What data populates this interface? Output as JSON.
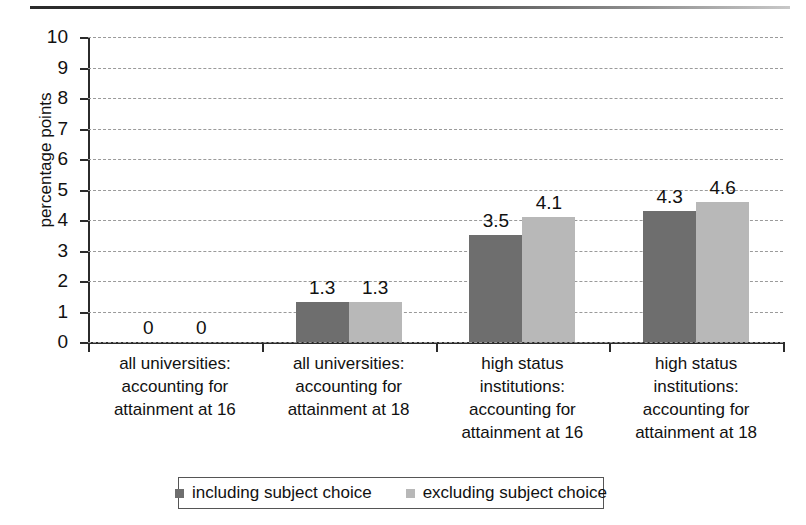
{
  "chart_data": {
    "type": "bar",
    "title": "",
    "xlabel": "",
    "ylabel": "percentage points",
    "ylim": [
      0,
      10
    ],
    "ytick_labels": [
      "10",
      "9",
      "8",
      "7",
      "6",
      "5",
      "4",
      "3",
      "2",
      "1",
      "0"
    ],
    "grid": true,
    "legend_position": "bottom",
    "categories": [
      "all universities:\naccounting for\nattainment at 16",
      "all universities:\naccounting for\nattainment at 18",
      "high status\ninstitutions:\naccounting for\nattainment at 16",
      "high status\ninstitutions:\naccounting for\nattainment at 18"
    ],
    "category_lines": [
      [
        "all universities:",
        "accounting for",
        "attainment at 16"
      ],
      [
        "all universities:",
        "accounting for",
        "attainment at 18"
      ],
      [
        "high status",
        "institutions:",
        "accounting for",
        "attainment at 16"
      ],
      [
        "high status",
        "institutions:",
        "accounting for",
        "attainment at 18"
      ]
    ],
    "series": [
      {
        "name": "including subject choice",
        "color": "#6e6e6e",
        "values": [
          0,
          1.3,
          3.5,
          4.3
        ],
        "labels": [
          "0",
          "1.3",
          "3.5",
          "4.3"
        ]
      },
      {
        "name": "excluding subject choice",
        "color": "#b8b8b8",
        "values": [
          0,
          1.3,
          4.1,
          4.6
        ],
        "labels": [
          "0",
          "1.3",
          "4.1",
          "4.6"
        ]
      }
    ]
  }
}
